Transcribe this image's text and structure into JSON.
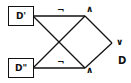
{
  "diagram": {
    "inputs": [
      {
        "id": "d_prime",
        "label": "D'"
      },
      {
        "id": "d_double_prime",
        "label": "D\""
      }
    ],
    "gates": {
      "not_top": "¬",
      "not_bottom": "¬",
      "and_top": "∧",
      "and_bottom": "∧",
      "or": "∨"
    },
    "output": {
      "label": "D"
    },
    "stroke_color": "#111111"
  }
}
